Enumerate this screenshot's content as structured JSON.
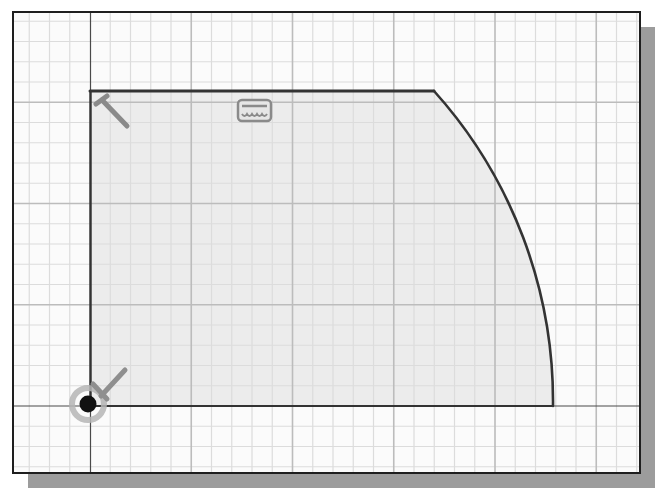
{
  "canvas": {
    "kind": "cad-sketch-viewport",
    "frame": {
      "x": 13,
      "y": 12,
      "width": 627,
      "height": 461
    },
    "shadow": {
      "offset": 15,
      "color": "#9c9c9c"
    },
    "background": "#fbfbfb",
    "profile_fill": "#ececec",
    "grid": {
      "origin_px": {
        "x": 90,
        "y": 406
      },
      "minor_spacing_px": 20.25,
      "major_every": 5,
      "minor_color": "#dcdcdc",
      "major_color": "#bcbcbc"
    },
    "axes": {
      "color": "#4a4a4a"
    }
  },
  "sketch": {
    "profile": {
      "description": "Closed profile: vertical left edge, horizontal top edge, arc centered at origin, horizontal bottom edge",
      "line_color": "#333333",
      "points": {
        "origin": {
          "x": 90,
          "y": 406
        },
        "top_left": {
          "x": 90,
          "y": 91
        },
        "top_right": {
          "x": 434,
          "y": 91
        },
        "arc_end": {
          "x": 553,
          "y": 406
        }
      },
      "arc_radius_px": 464
    },
    "constraints": [
      {
        "type": "fix",
        "icon": "fix-constraint-icon",
        "at": "origin"
      },
      {
        "type": "perpendicular",
        "icon": "perpendicular-constraint-icon",
        "at": "top_left"
      },
      {
        "type": "horizontal",
        "icon": "horizontal-constraint-icon",
        "at": "top-edge"
      }
    ],
    "origin_point": {
      "label": "Sketch origin",
      "color": "#111111",
      "halo_color": "#9a9a9a"
    }
  },
  "labels": {
    "title": "2D sketch profile with constraints"
  }
}
